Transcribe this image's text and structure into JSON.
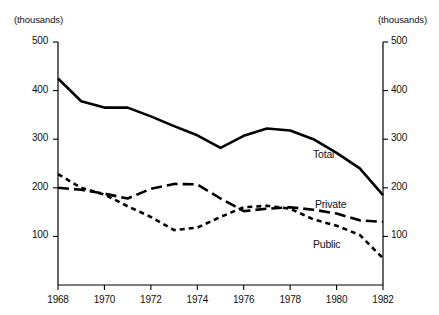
{
  "chart_data": {
    "type": "line",
    "title": "",
    "subtitle": "",
    "xlabel": "",
    "ylabel": "",
    "unit_note_left": "(thousands)",
    "unit_note_right": "(thousands)",
    "x": [
      1968,
      1969,
      1970,
      1971,
      1972,
      1973,
      1974,
      1975,
      1976,
      1977,
      1978,
      1979,
      1980,
      1981,
      1982
    ],
    "xlim": [
      1968,
      1982
    ],
    "ylim": [
      0,
      500
    ],
    "xticks": [
      1968,
      1970,
      1972,
      1974,
      1976,
      1978,
      1980,
      1982
    ],
    "xtick_labels": [
      "1968",
      "1970",
      "1972",
      "1974",
      "1976",
      "1978",
      "1980",
      "1982"
    ],
    "yticks": [
      100,
      200,
      300,
      400,
      500
    ],
    "ytick_labels": [
      "100",
      "200",
      "300",
      "400",
      "500"
    ],
    "ytick_labels_right": [
      "100",
      "200",
      "300",
      "400",
      "500"
    ],
    "grid": false,
    "legend_position": "inline-labels",
    "series": [
      {
        "name": "Total",
        "style": "solid",
        "color": "#000000",
        "label_text": "Total",
        "values": [
          425,
          378,
          365,
          365,
          347,
          327,
          308,
          282,
          307,
          322,
          318,
          300,
          272,
          240,
          185
        ]
      },
      {
        "name": "Private",
        "style": "long-dash",
        "color": "#000000",
        "label_text": "Private",
        "values": [
          200,
          196,
          188,
          178,
          198,
          208,
          207,
          178,
          152,
          157,
          160,
          155,
          147,
          133,
          130
        ]
      },
      {
        "name": "Public",
        "style": "short-dash",
        "color": "#000000",
        "label_text": "Public",
        "values": [
          228,
          200,
          186,
          162,
          140,
          113,
          118,
          140,
          160,
          163,
          157,
          135,
          122,
          103,
          55
        ]
      }
    ]
  },
  "axis": {
    "unit_left": "(thousands)",
    "unit_right": "(thousands)"
  },
  "labels": {
    "total": "Total",
    "private": "Private",
    "public": "Public"
  }
}
